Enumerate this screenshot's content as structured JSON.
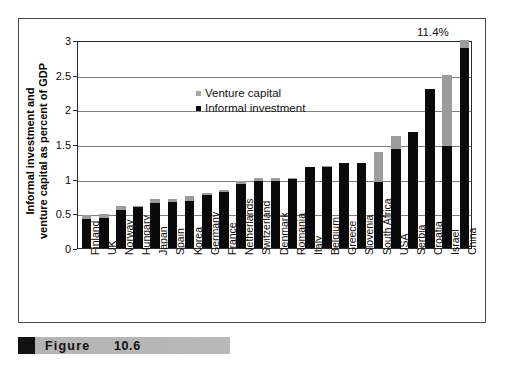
{
  "figure": {
    "caption_label": "Figure",
    "caption_number": "10.6"
  },
  "annotation": {
    "china_value_label": "11.4%"
  },
  "legend": {
    "position": "inside-top-left",
    "items": [
      {
        "label": "Venture capital",
        "color": "#a8a8a8"
      },
      {
        "label": "Informal investment",
        "color": "#0a0a0a"
      }
    ]
  },
  "chart_data": {
    "type": "bar",
    "stacked": true,
    "title": "",
    "xlabel": "",
    "ylabel": "Informal investment and venture capital as percent of GDP",
    "ylim": [
      0,
      3
    ],
    "yticks": [
      "0",
      "0.5",
      "1",
      "1.5",
      "2",
      "2.5",
      "3"
    ],
    "ytick_values": [
      0,
      0.5,
      1,
      1.5,
      2,
      2.5,
      3
    ],
    "grid": true,
    "legend_position": "upper left inside plot",
    "note": "China informal investment bar is truncated at axis maximum; true total is 11.4%",
    "categories": [
      "Finland",
      "UK",
      "Norway",
      "Hungary",
      "Japan",
      "Spain",
      "Korea",
      "Germany",
      "France",
      "Netherlands",
      "Switzerland",
      "Denmark",
      "Romania",
      "Italy",
      "Belgium",
      "Greece",
      "Slovenia",
      "South Africa",
      "USA",
      "Serbia",
      "Croatia",
      "Israel",
      "China"
    ],
    "series": [
      {
        "name": "Informal investment",
        "color": "#0a0a0a",
        "values": [
          0.42,
          0.43,
          0.55,
          0.59,
          0.65,
          0.66,
          0.68,
          0.77,
          0.81,
          0.92,
          0.97,
          0.96,
          1.0,
          1.17,
          1.17,
          1.22,
          1.23,
          0.95,
          1.43,
          1.67,
          2.3,
          1.47,
          2.88
        ]
      },
      {
        "name": "Venture capital",
        "color": "#9c9c9c",
        "values": [
          0.06,
          0.06,
          0.05,
          0.01,
          0.05,
          0.05,
          0.07,
          0.03,
          0.02,
          0.04,
          0.04,
          0.05,
          0.01,
          0.0,
          0.02,
          0.0,
          0.0,
          0.43,
          0.19,
          0.0,
          0.0,
          1.03,
          0.12
        ]
      }
    ],
    "totals": [
      0.48,
      0.49,
      0.6,
      0.6,
      0.7,
      0.71,
      0.75,
      0.8,
      0.83,
      0.96,
      1.01,
      1.01,
      1.01,
      1.17,
      1.19,
      1.22,
      1.23,
      1.38,
      1.62,
      1.67,
      2.3,
      2.5,
      3.0
    ]
  }
}
